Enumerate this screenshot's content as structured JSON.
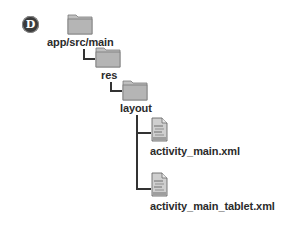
{
  "badge": {
    "letter": "D",
    "color": "#3a3a3a"
  },
  "tree": {
    "nodes": [
      {
        "type": "folder",
        "label": "app/src/main",
        "level": 0
      },
      {
        "type": "folder",
        "label": "res",
        "level": 1
      },
      {
        "type": "folder",
        "label": "layout",
        "level": 2
      },
      {
        "type": "file",
        "label": "activity_main.xml",
        "level": 3
      },
      {
        "type": "file",
        "label": "activity_main_tablet.xml",
        "level": 3
      }
    ]
  },
  "colors": {
    "folder": "#a9a9a9",
    "text": "#2b2b2b",
    "connector": "#333333"
  }
}
